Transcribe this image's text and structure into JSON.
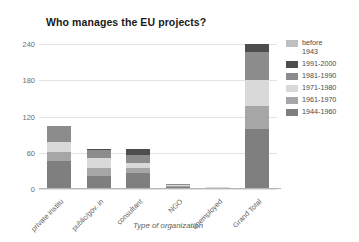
{
  "chart_data": {
    "type": "bar",
    "subtype": "stacked-column",
    "title": "Who manages the EU projects?",
    "xlabel": "Type of organization",
    "ylabel": "",
    "ylim": [
      0,
      240
    ],
    "yticks": [
      0,
      60,
      120,
      180,
      240
    ],
    "ytick_labels": [
      "0",
      "60",
      "120",
      "180",
      "240"
    ],
    "grid": true,
    "grid_axis": "y",
    "legend_position": "right",
    "categories": [
      "private institu",
      "public/gov. in",
      "consultant",
      "NGO",
      "unemployed",
      "Grand Total"
    ],
    "series": [
      {
        "name": "1944-1960",
        "color": "#7f7f7f",
        "values": [
          47,
          22,
          26,
          3,
          1,
          99
        ]
      },
      {
        "name": "1961-1970",
        "color": "#a6a6a6",
        "values": [
          15,
          13,
          8,
          2,
          1,
          39
        ]
      },
      {
        "name": "1971-1980",
        "color": "#d9d9d9",
        "values": [
          15,
          16,
          9,
          2,
          1,
          43
        ]
      },
      {
        "name": "1981-1990",
        "color": "#8c8c8c",
        "values": [
          28,
          14,
          13,
          1,
          0,
          46
        ]
      },
      {
        "name": "1991-2000",
        "color": "#4d4d4d",
        "values": [
          0,
          2,
          10,
          0,
          0,
          13
        ]
      },
      {
        "name": "before 1943",
        "color": "#bfbfbf",
        "values": [
          0,
          0,
          1,
          0,
          0,
          0
        ]
      }
    ],
    "totals": [
      105,
      67,
      67,
      8,
      3,
      240
    ]
  },
  "legend": {
    "entries": [
      {
        "label": "before\n1943",
        "color": "#bfbfbf"
      },
      {
        "label": "1991-2000",
        "color": "#4d4d4d"
      },
      {
        "label": "1981-1990",
        "color": "#8c8c8c"
      },
      {
        "label": "1971-1980",
        "color": "#d9d9d9"
      },
      {
        "label": "1961-1970",
        "color": "#a6a6a6"
      },
      {
        "label": "1944-1960",
        "color": "#7f7f7f"
      }
    ]
  },
  "colors": {
    "background": "#ffffff",
    "grid": "#e2e2e2",
    "axis": "#b5b5b5",
    "title_text": "#1a1a1a",
    "tick_text": "#6e6e6e",
    "label_text": "#5d5d5d"
  }
}
